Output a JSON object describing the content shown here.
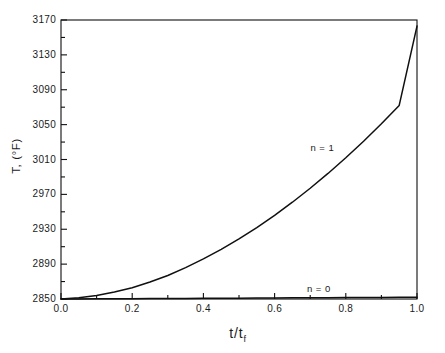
{
  "chart_data": {
    "type": "line",
    "title": "",
    "xlabel": "t/tf",
    "ylabel": "T, (°F)",
    "xlim": [
      0.0,
      1.0
    ],
    "ylim": [
      2850,
      3170
    ],
    "grid": false,
    "legend_position": "inline-annotation",
    "x_ticks": [
      "0.0",
      "0.2",
      "0.4",
      "0.6",
      "0.8",
      "1.0"
    ],
    "x_tick_values": [
      0.0,
      0.2,
      0.4,
      0.6,
      0.8,
      1.0
    ],
    "x_minor_tick_values": [
      0.1,
      0.3,
      0.5,
      0.7,
      0.9
    ],
    "y_ticks": [
      "2850",
      "2890",
      "2930",
      "2970",
      "3010",
      "3050",
      "3090",
      "3130",
      "3170"
    ],
    "y_tick_values": [
      2850,
      2890,
      2930,
      2970,
      3010,
      3050,
      3090,
      3130,
      3170
    ],
    "y_minor_tick_values": [
      2870,
      2910,
      2950,
      2990,
      3030,
      3070,
      3110,
      3150
    ],
    "x": [
      0.0,
      0.05,
      0.1,
      0.15,
      0.2,
      0.25,
      0.3,
      0.35,
      0.4,
      0.45,
      0.5,
      0.55,
      0.6,
      0.65,
      0.7,
      0.75,
      0.8,
      0.85,
      0.9,
      0.95,
      1.0
    ],
    "series": [
      {
        "name": "n = 1",
        "label": "n = 1",
        "color": "#101010",
        "values": [
          2850,
          2851.5,
          2854,
          2858,
          2863,
          2869.5,
          2877,
          2886,
          2896,
          2907,
          2919,
          2932,
          2946,
          2961,
          2977,
          2994,
          3012,
          3031,
          3051,
          3072,
          3163
        ]
      },
      {
        "name": "n = 0",
        "label": "n = 0",
        "color": "#101010",
        "values": [
          2850,
          2850.1,
          2850.2,
          2850.3,
          2850.4,
          2850.5,
          2850.6,
          2850.7,
          2850.8,
          2850.9,
          2851.0,
          2851.1,
          2851.2,
          2851.3,
          2851.4,
          2851.5,
          2851.6,
          2851.7,
          2851.8,
          2851.9,
          2852.0
        ]
      }
    ],
    "annotations": [
      {
        "text": "n = 1",
        "x": 0.74,
        "y": 3023
      },
      {
        "text": "n = 0",
        "x": 0.73,
        "y": 2861
      }
    ]
  },
  "figure": {
    "frame_color": "#101010",
    "background": "#ffffff",
    "top_edge_artifact": "       "
  }
}
